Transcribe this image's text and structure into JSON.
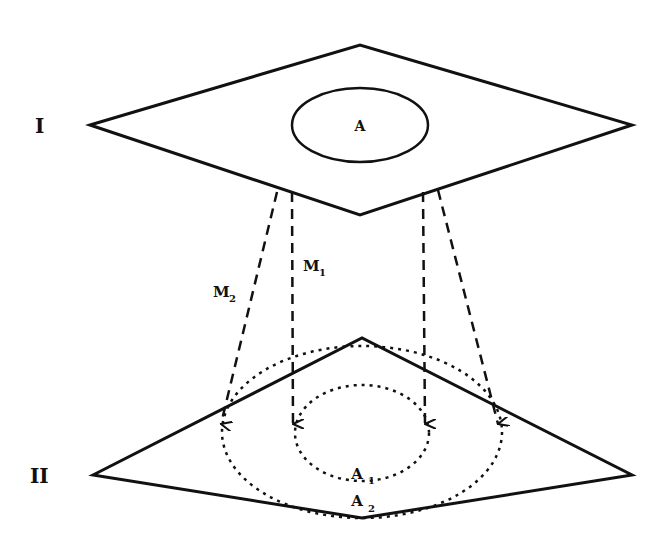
{
  "diagram": {
    "planes": [
      {
        "id": "I",
        "label": "I",
        "region": "A",
        "points": "90,125 360,45 632,125 360,215"
      },
      {
        "id": "II",
        "label": "II",
        "region_inner": "A",
        "region_inner_sub": "1",
        "region_outer": "A",
        "region_outer_sub": "2",
        "points": "93,475 362,338 632,475 362,518"
      }
    ],
    "mappings": [
      {
        "label": "M",
        "sub": "1"
      },
      {
        "label": "M",
        "sub": "2"
      }
    ],
    "colors": {
      "stroke": "#111111",
      "background": "#ffffff"
    }
  }
}
